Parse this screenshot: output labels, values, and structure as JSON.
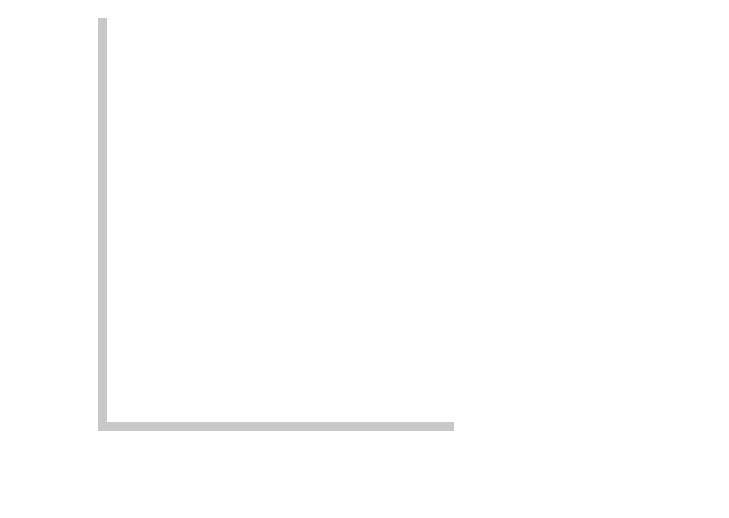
{
  "diagram": {
    "y_axis_label": "Interest rate",
    "x_axis_label": "Income, output",
    "y_axis_symbol": "i",
    "x_axis_symbol": "Y",
    "origin_label": "0",
    "y0_label_main": "Y",
    "y0_label_sub": "0",
    "if_label_main": "i = i",
    "if_label_sub": "f",
    "bop_label_b": "B",
    "bop_label_sub": "0",
    "bop_label_rest": "P = 0",
    "curves": {
      "lm": "LM",
      "is": "IS",
      "is_prime": "IS′"
    },
    "points": {
      "e": "E",
      "e_prime": "E′"
    },
    "colors": {
      "axis": "#c8c8c8",
      "curve": "#111111",
      "bop_line": "#cccccc",
      "text": "#222222"
    }
  }
}
